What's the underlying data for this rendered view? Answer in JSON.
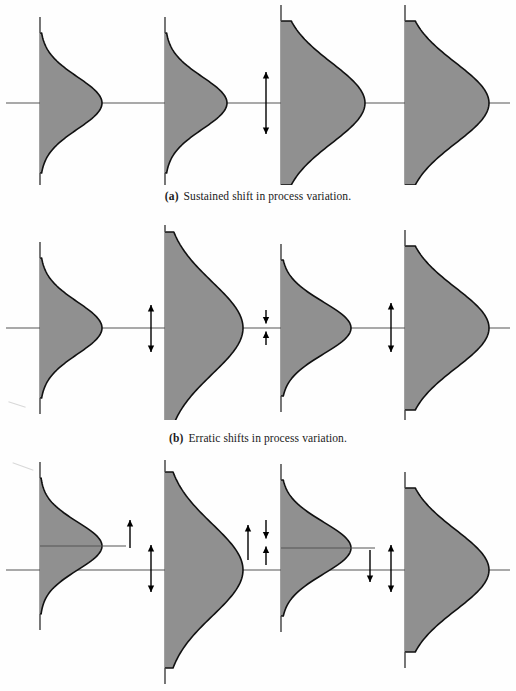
{
  "figure": {
    "background_color": "#fefefe",
    "curve_fill_color": "#909090",
    "curve_stroke_color": "#111111",
    "axis_color": "#555555",
    "arrow_color": "#000000"
  },
  "panels": [
    {
      "id": "a",
      "label": "(a)",
      "caption": "Sustained shift in process variation.",
      "caption_label": "(a)",
      "caption_text": "Sustained shift in process variation."
    },
    {
      "id": "b",
      "label": "(b)",
      "caption": "Erratic shifts in process variation.",
      "caption_label": "(b)",
      "caption_text": "Erratic shifts in process variation."
    },
    {
      "id": "c",
      "label": "(c)",
      "caption": "",
      "caption_label": "",
      "caption_text": ""
    }
  ],
  "chart_data": {
    "type": "area",
    "xlabel": "",
    "ylabel": "",
    "grid": false,
    "legend": null,
    "panels": [
      {
        "id": "a",
        "caption": "Sustained shift in process variation.",
        "baseline_y": 103,
        "axis_x": [
          40,
          165,
          281,
          405
        ],
        "curves": [
          {
            "index": 1,
            "axis_x": 40,
            "mean_offset": 0,
            "sigma": 26,
            "peak_width": 62,
            "height_half": 70
          },
          {
            "index": 2,
            "axis_x": 165,
            "mean_offset": 0,
            "sigma": 26,
            "peak_width": 62,
            "height_half": 70
          },
          {
            "index": 3,
            "axis_x": 281,
            "mean_offset": 0,
            "sigma": 40,
            "peak_width": 84,
            "height_half": 82
          },
          {
            "index": 4,
            "axis_x": 405,
            "mean_offset": 0,
            "sigma": 40,
            "peak_width": 84,
            "height_half": 82
          }
        ],
        "arrows": [
          {
            "x": 266,
            "y_top": 72,
            "y_bottom": 134,
            "heads": "both",
            "meaning": "increase-in-spread"
          }
        ]
      },
      {
        "id": "b",
        "caption": "Erratic shifts in process variation.",
        "baseline_y": 328,
        "axis_x": [
          40,
          165,
          281,
          405
        ],
        "curves": [
          {
            "index": 1,
            "axis_x": 40,
            "mean_offset": 0,
            "sigma": 26,
            "peak_width": 62,
            "height_half": 70
          },
          {
            "index": 2,
            "axis_x": 165,
            "mean_offset": 0,
            "sigma": 46,
            "peak_width": 78,
            "height_half": 96
          },
          {
            "index": 3,
            "axis_x": 281,
            "mean_offset": 0,
            "sigma": 26,
            "peak_width": 70,
            "height_half": 68
          },
          {
            "index": 4,
            "axis_x": 405,
            "mean_offset": 0,
            "sigma": 40,
            "peak_width": 84,
            "height_half": 82
          }
        ],
        "arrows": [
          {
            "x": 151,
            "y_top": 305,
            "y_bottom": 352,
            "heads": "both",
            "meaning": "spread-increase"
          },
          {
            "x": 266,
            "y_top": 310,
            "y_bottom": 345,
            "heads": "inward",
            "meaning": "spread-decrease"
          },
          {
            "x": 391,
            "y_top": 303,
            "y_bottom": 352,
            "heads": "both",
            "meaning": "spread-increase"
          }
        ]
      },
      {
        "id": "c",
        "caption": "",
        "baseline_y": 570,
        "axis_x": [
          40,
          165,
          281,
          405
        ],
        "curves": [
          {
            "index": 1,
            "axis_x": 40,
            "mean_offset": -24,
            "sigma": 24,
            "peak_width": 62,
            "height_half": 68,
            "mean_line": true
          },
          {
            "index": 2,
            "axis_x": 165,
            "mean_offset": 0,
            "sigma": 46,
            "peak_width": 78,
            "height_half": 98
          },
          {
            "index": 3,
            "axis_x": 281,
            "mean_offset": -22,
            "sigma": 26,
            "peak_width": 70,
            "height_half": 68,
            "mean_line": true
          },
          {
            "index": 4,
            "axis_x": 405,
            "mean_offset": 0,
            "sigma": 40,
            "peak_width": 84,
            "height_half": 82
          }
        ],
        "arrows": [
          {
            "x": 130,
            "y_top": 520,
            "y_bottom": 548,
            "heads": "up",
            "meaning": "mean-shift-up"
          },
          {
            "x": 151,
            "y_top": 545,
            "y_bottom": 592,
            "heads": "both",
            "meaning": "spread"
          },
          {
            "x": 248,
            "y_top": 525,
            "y_bottom": 560,
            "heads": "up",
            "meaning": "mean-shift-up"
          },
          {
            "x": 266,
            "y_top": 520,
            "y_bottom": 565,
            "heads": "inward",
            "meaning": "spread-decrease"
          },
          {
            "x": 370,
            "y_top": 550,
            "y_bottom": 582,
            "heads": "down",
            "meaning": "mean-shift-down"
          },
          {
            "x": 391,
            "y_top": 545,
            "y_bottom": 592,
            "heads": "both",
            "meaning": "spread"
          }
        ]
      }
    ]
  }
}
